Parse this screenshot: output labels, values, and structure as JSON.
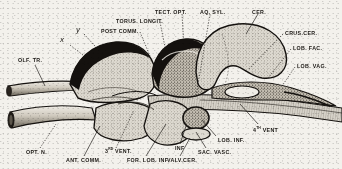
{
  "figure": {
    "background_color": "#f3f1ec",
    "ink_color": "#1a1713",
    "fill_light": "#d8d4cb",
    "fill_mid": "#b9b3a7",
    "fill_dark": "#141210"
  },
  "labels": [
    {
      "id": "olf-tr",
      "text": "OLF. TR.",
      "x": 18,
      "y": 58,
      "style": "caps"
    },
    {
      "id": "marker-x",
      "text": "x",
      "x": 60,
      "y": 40,
      "style": "italic"
    },
    {
      "id": "marker-y",
      "text": "y",
      "x": 76,
      "y": 30,
      "style": "italic"
    },
    {
      "id": "post-comm",
      "text": "POST  COMM.",
      "x": 101,
      "y": 29,
      "style": "caps"
    },
    {
      "id": "torus-longit",
      "text": "TORUS. LONGIT.",
      "x": 116,
      "y": 19,
      "style": "caps"
    },
    {
      "id": "tect-opt",
      "text": "TECT. OPT.",
      "x": 155,
      "y": 10,
      "style": "caps"
    },
    {
      "id": "aq-syl",
      "text": "AQ. SYL.",
      "x": 200,
      "y": 10,
      "style": "caps"
    },
    {
      "id": "cer",
      "text": "CER.",
      "x": 252,
      "y": 10,
      "style": "caps"
    },
    {
      "id": "crus-cer",
      "text": "CRUS.CER.",
      "x": 285,
      "y": 31,
      "style": "caps"
    },
    {
      "id": "lob-fac",
      "text": "LOB. FAC.",
      "x": 293,
      "y": 46,
      "style": "caps"
    },
    {
      "id": "lob-vag",
      "text": "LOB. VAG.",
      "x": 297,
      "y": 64,
      "style": "caps"
    },
    {
      "id": "vent-4",
      "text": "4",
      "sup": "TH",
      "tail": " VENT",
      "x": 253,
      "y": 127,
      "style": "caps-sup"
    },
    {
      "id": "lob-inf",
      "text": "LOB. INF.",
      "x": 218,
      "y": 138,
      "style": "caps"
    },
    {
      "id": "sac-vasc",
      "text": "SAC. VASC.",
      "x": 198,
      "y": 150,
      "style": "caps"
    },
    {
      "id": "valv-cer",
      "text": "VALV.CER.",
      "x": 167,
      "y": 158,
      "style": "caps"
    },
    {
      "id": "inf",
      "text": "INF",
      "x": 175,
      "y": 146,
      "style": "caps"
    },
    {
      "id": "for-lob-inf",
      "text": "FOR. LOB. INF.",
      "x": 127,
      "y": 158,
      "style": "caps"
    },
    {
      "id": "vent-3",
      "text": "3",
      "sup": "RD",
      "tail": " VENT.",
      "x": 105,
      "y": 150,
      "style": "caps-sup"
    },
    {
      "id": "ant-comm",
      "text": "ANT. COMM.",
      "x": 66,
      "y": 158,
      "style": "caps"
    },
    {
      "id": "opt-n",
      "text": "OPT. N.",
      "x": 26,
      "y": 150,
      "style": "caps"
    }
  ]
}
